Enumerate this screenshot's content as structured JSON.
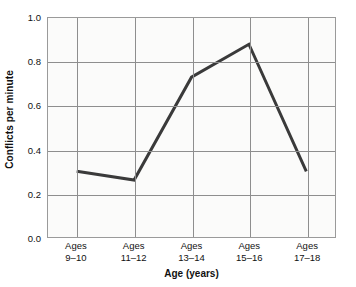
{
  "chart_data": {
    "type": "line",
    "title": "",
    "subtitle": "",
    "xlabel": "Age (years)",
    "ylabel": "Conflicts per minute",
    "categories": [
      "Ages\n9–10",
      "Ages\n11–12",
      "Ages\n13–14",
      "Ages\n15–16",
      "Ages\n17–18"
    ],
    "category_lines": [
      [
        "Ages",
        "9–10"
      ],
      [
        "Ages",
        "11–12"
      ],
      [
        "Ages",
        "13–14"
      ],
      [
        "Ages",
        "15–16"
      ],
      [
        "Ages",
        "17–18"
      ]
    ],
    "values": [
      0.3,
      0.26,
      0.73,
      0.88,
      0.3
    ],
    "ylim": [
      0.0,
      1.0
    ],
    "yticks": [
      0.0,
      0.2,
      0.4,
      0.6,
      0.8,
      1.0
    ],
    "ytick_labels": [
      "0.0",
      "0.2",
      "0.4",
      "0.6",
      "0.8",
      "1.0"
    ],
    "grid": true,
    "grid_axes": "both",
    "legend": false,
    "legend_position": "none",
    "markers": false,
    "line_color": "#3a3a3a",
    "line_width": 3,
    "plot_background": "#fbfbfa",
    "grid_color": "#8e8e8e",
    "frame_color": "#9a9a9a",
    "text_color": "#111111",
    "figure_background": "#ffffff"
  }
}
